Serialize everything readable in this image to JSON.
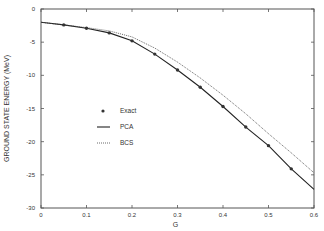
{
  "chart_data": {
    "type": "line",
    "title": "",
    "xlabel": "G",
    "ylabel": "GROUND STATE ENERGY (MeV)",
    "xlim": [
      0,
      0.6
    ],
    "ylim": [
      -30,
      0
    ],
    "xticks": [
      0,
      0.1,
      0.2,
      0.3,
      0.4,
      0.5,
      0.6
    ],
    "xtick_labels": [
      "0",
      "0.1",
      "0.2",
      "0.3",
      "0.4",
      "0.5",
      "0.6"
    ],
    "yticks": [
      0,
      -5,
      -10,
      -15,
      -20,
      -25,
      -30
    ],
    "ytick_labels": [
      "0",
      "-5",
      "-10",
      "-15",
      "-20",
      "-25",
      "-30"
    ],
    "grid": false,
    "legend_position": "center-left",
    "series": [
      {
        "name": "Exact",
        "style": "markers",
        "x": [
          0.05,
          0.1,
          0.15,
          0.2,
          0.25,
          0.3,
          0.35,
          0.4,
          0.45,
          0.5,
          0.55
        ],
        "y": [
          -2.4,
          -2.9,
          -3.6,
          -4.8,
          -6.8,
          -9.2,
          -11.8,
          -14.7,
          -17.8,
          -20.6,
          -24.1
        ]
      },
      {
        "name": "PCA",
        "style": "solid",
        "x": [
          0,
          0.05,
          0.1,
          0.15,
          0.2,
          0.25,
          0.3,
          0.35,
          0.4,
          0.45,
          0.5,
          0.55,
          0.6
        ],
        "y": [
          -2.0,
          -2.4,
          -2.9,
          -3.6,
          -4.8,
          -6.8,
          -9.2,
          -11.8,
          -14.7,
          -17.8,
          -20.6,
          -24.1,
          -27.2
        ]
      },
      {
        "name": "BCS",
        "style": "dotted",
        "x": [
          0,
          0.05,
          0.1,
          0.15,
          0.2,
          0.25,
          0.3,
          0.35,
          0.4,
          0.45,
          0.5,
          0.55,
          0.6
        ],
        "y": [
          -2.0,
          -2.4,
          -2.8,
          -3.3,
          -4.2,
          -5.9,
          -8.0,
          -10.4,
          -13.0,
          -15.8,
          -18.8,
          -21.7,
          -24.7
        ]
      }
    ],
    "colors": {
      "axis": "#555555",
      "line": "#222222",
      "marker": "#333333"
    }
  }
}
